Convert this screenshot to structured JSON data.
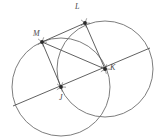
{
  "figure": {
    "kind": "geometry-diagram",
    "background_color": "#ffffff",
    "stroke_color": "#6e6e6e",
    "segment_color": "#4f4f4f",
    "label_color": "#4a4a4a",
    "point_color": "#2b2b2b"
  },
  "labels": [
    {
      "id": "label-M",
      "text": "M",
      "x": 33,
      "y": 30
    },
    {
      "id": "label-L",
      "text": "L",
      "x": 75,
      "y": 3
    },
    {
      "id": "label-K",
      "text": "K",
      "x": 110,
      "y": 64
    },
    {
      "id": "label-J",
      "text": "J",
      "x": 59,
      "y": 94
    }
  ],
  "points": [
    {
      "id": "point-M",
      "name": "M",
      "x": 42,
      "y": 42
    },
    {
      "id": "point-L",
      "name": "L",
      "x": 85,
      "y": 23
    },
    {
      "id": "point-K",
      "name": "K",
      "x": 105,
      "y": 69
    },
    {
      "id": "point-J",
      "name": "J",
      "x": 61,
      "y": 87
    }
  ],
  "circles": [
    {
      "id": "circle-J",
      "center": "J",
      "cx": 61,
      "cy": 87,
      "r": 49
    },
    {
      "id": "circle-K",
      "center": "K",
      "cx": 105,
      "cy": 69,
      "r": 48
    }
  ],
  "segments": [
    {
      "id": "segment-MJ",
      "from": "M",
      "to": "J",
      "x1": 42,
      "y1": 42,
      "x2": 61,
      "y2": 87
    },
    {
      "id": "segment-ML",
      "from": "M",
      "to": "L",
      "x1": 42,
      "y1": 42,
      "x2": 85,
      "y2": 23
    },
    {
      "id": "segment-LK",
      "from": "L",
      "to": "K",
      "x1": 85,
      "y1": 23,
      "x2": 105,
      "y2": 69
    },
    {
      "id": "segment-MK",
      "from": "M",
      "to": "K",
      "x1": 42,
      "y1": 42,
      "x2": 105,
      "y2": 69
    }
  ],
  "diagonal_line": {
    "id": "line-JK-extended",
    "through": "J and K",
    "x1": 13,
    "y1": 106,
    "x2": 150,
    "y2": 48
  },
  "tick_marks": {
    "description": "small asterisk/star hatch marks drawn at each labelled point",
    "arm_count": 5,
    "arm_length": 5
  }
}
